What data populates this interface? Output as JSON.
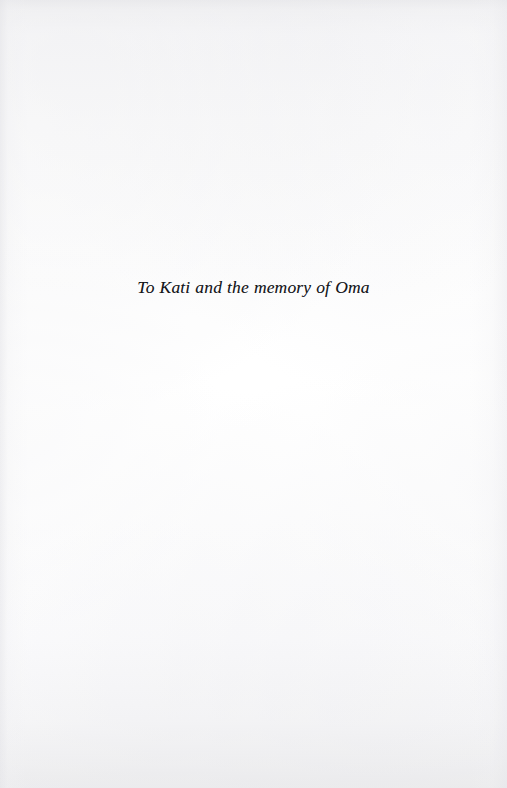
{
  "page": {
    "kind": "book-dedication-page",
    "width": 507,
    "height": 788,
    "background_color": "#fdfdfd",
    "paper_tone_color": "#f6f6f7",
    "edge_shade_color": "#ededef"
  },
  "dedication": {
    "text": "To Kati and the memory of Oma",
    "style": "italic",
    "alignment": "center",
    "text_color": "#15161a"
  }
}
